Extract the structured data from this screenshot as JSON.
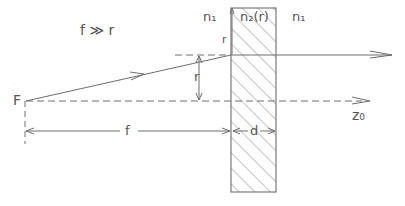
{
  "diagram": {
    "condition": "f ≫ r",
    "focal_point_label": "F",
    "medium_left_label": "n₁",
    "slab_label": "n₂(r)",
    "medium_right_label": "n₁",
    "ray_height_label": "r",
    "focal_length_label": "f",
    "thickness_label": "d",
    "axis_label": "z₀",
    "small_r_label": "r",
    "colors": {
      "stroke": "#6e6e6e",
      "text": "#555555",
      "hatch": "#7a7a7a"
    }
  }
}
